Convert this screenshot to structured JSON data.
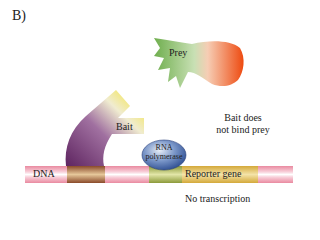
{
  "panel_label": "B)",
  "labels": {
    "prey": "Prey",
    "bait": "Bait",
    "rna_polymerase_line1": "RNA",
    "rna_polymerase_line2": "polymerase",
    "dna": "DNA",
    "reporter_gene": "Reporter gene",
    "note_line1": "Bait does",
    "note_line2": "not bind prey",
    "result": "No transcription"
  },
  "colors": {
    "dna_strand": "#f0a0b0",
    "dna_highlight": "#fbe4ea",
    "binding_site": "#a0522d",
    "reporter_gene": "#d9b44a",
    "promoter": "#9aa040",
    "bait_yellow": "#f5e21c",
    "bait_purple": "#6b2d6b",
    "prey_green": "#8cbf6a",
    "prey_orange": "#f05a1e",
    "polymerase_blue": "#3a5ea8"
  }
}
